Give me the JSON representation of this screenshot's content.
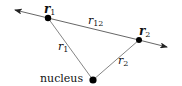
{
  "diagram": {
    "title": "",
    "nodes": {
      "electron1": {
        "label": "r",
        "sub": "1",
        "x": 48,
        "y": 18
      },
      "electron2": {
        "label": "r",
        "sub": "2",
        "x": 139,
        "y": 40
      },
      "nucleus": {
        "label": "nucleus",
        "x": 93,
        "y": 80
      }
    },
    "edges": {
      "r12": {
        "label": "r",
        "sub": "12"
      },
      "r1": {
        "label": "r",
        "sub": "1"
      },
      "r2": {
        "label": "r",
        "sub": "2"
      }
    },
    "colors": {
      "line": "#555555",
      "dot": "#000000",
      "text": "#111111"
    }
  }
}
